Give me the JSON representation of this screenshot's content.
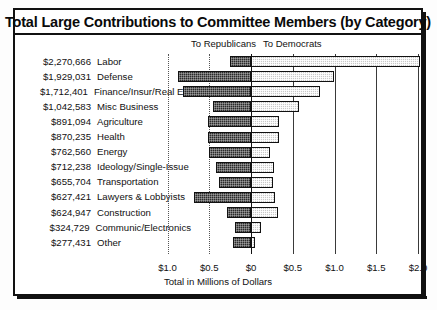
{
  "chart": {
    "title": "Total Large Contributions to Committee Members (by Category)",
    "legend": {
      "republicans": "To Republicans",
      "democrats": "To Democrats"
    },
    "xlabel": "Total in Millions of Dollars"
  },
  "chart_data": {
    "type": "bar",
    "orientation": "horizontal",
    "style": "diverging-stacked",
    "title": "Total Large Contributions to Committee Members (by Category)",
    "subtitle": "",
    "xlabel": "Total in Millions of Dollars",
    "ylabel": "",
    "grid": true,
    "legend_position": "top",
    "legend": [
      "To Republicans",
      "To Democrats"
    ],
    "xlim": [
      -1.0,
      2.0
    ],
    "xticks": [
      -1.0,
      -0.5,
      0,
      0.5,
      1.0,
      1.5,
      2.0
    ],
    "xtick_labels": [
      "$1.0",
      "$0.5",
      "$0",
      "$0.5",
      "$1.0",
      "$1.5",
      "$2.0"
    ],
    "categories": [
      "Labor",
      "Defense",
      "Finance/Insur/Real Est",
      "Misc Business",
      "Agriculture",
      "Health",
      "Energy",
      "Ideology/Single-Issue",
      "Transportation",
      "Lawyers & Lobbyists",
      "Construction",
      "Communic/Electronics",
      "Other"
    ],
    "totals_labels": [
      "$2,270,666",
      "$1,929,031",
      "$1,712,401",
      "$1,042,583",
      "$891,094",
      "$870,235",
      "$762,560",
      "$712,238",
      "$655,704",
      "$627,421",
      "$624,947",
      "$324,729",
      "$277,431"
    ],
    "series": [
      {
        "name": "To Republicans",
        "note": "plotted leftward from zero, values in millions of dollars",
        "values": [
          0.25,
          0.88,
          0.81,
          0.45,
          0.51,
          0.51,
          0.5,
          0.42,
          0.38,
          0.68,
          0.29,
          0.19,
          0.22
        ]
      },
      {
        "name": "To Democrats",
        "note": "plotted rightward from zero, values in millions of dollars",
        "values": [
          2.02,
          0.99,
          0.83,
          0.57,
          0.34,
          0.34,
          0.23,
          0.28,
          0.26,
          0.29,
          0.32,
          0.12,
          0.05
        ]
      }
    ],
    "rows": [
      {
        "category": "Labor",
        "total": "$2,270,666",
        "rep": 0.25,
        "dem": 2.02
      },
      {
        "category": "Defense",
        "total": "$1,929,031",
        "rep": 0.88,
        "dem": 0.99
      },
      {
        "category": "Finance/Insur/Real Est",
        "total": "$1,712,401",
        "rep": 0.81,
        "dem": 0.83
      },
      {
        "category": "Misc Business",
        "total": "$1,042,583",
        "rep": 0.45,
        "dem": 0.57
      },
      {
        "category": "Agriculture",
        "total": "$891,094",
        "rep": 0.51,
        "dem": 0.34
      },
      {
        "category": "Health",
        "total": "$870,235",
        "rep": 0.51,
        "dem": 0.34
      },
      {
        "category": "Energy",
        "total": "$762,560",
        "rep": 0.5,
        "dem": 0.23
      },
      {
        "category": "Ideology/Single-Issue",
        "total": "$712,238",
        "rep": 0.42,
        "dem": 0.28
      },
      {
        "category": "Transportation",
        "total": "$655,704",
        "rep": 0.38,
        "dem": 0.26
      },
      {
        "category": "Lawyers & Lobbyists",
        "total": "$627,421",
        "rep": 0.68,
        "dem": 0.29
      },
      {
        "category": "Construction",
        "total": "$624,947",
        "rep": 0.29,
        "dem": 0.32
      },
      {
        "category": "Communic/Electronics",
        "total": "$324,729",
        "rep": 0.19,
        "dem": 0.12
      },
      {
        "category": "Other",
        "total": "$277,431",
        "rep": 0.22,
        "dem": 0.05
      }
    ],
    "colors": {
      "republicans": "#2b2b2b",
      "democrats": "#c9c9c9",
      "frame": "#111111",
      "background": "#ffffff"
    }
  }
}
